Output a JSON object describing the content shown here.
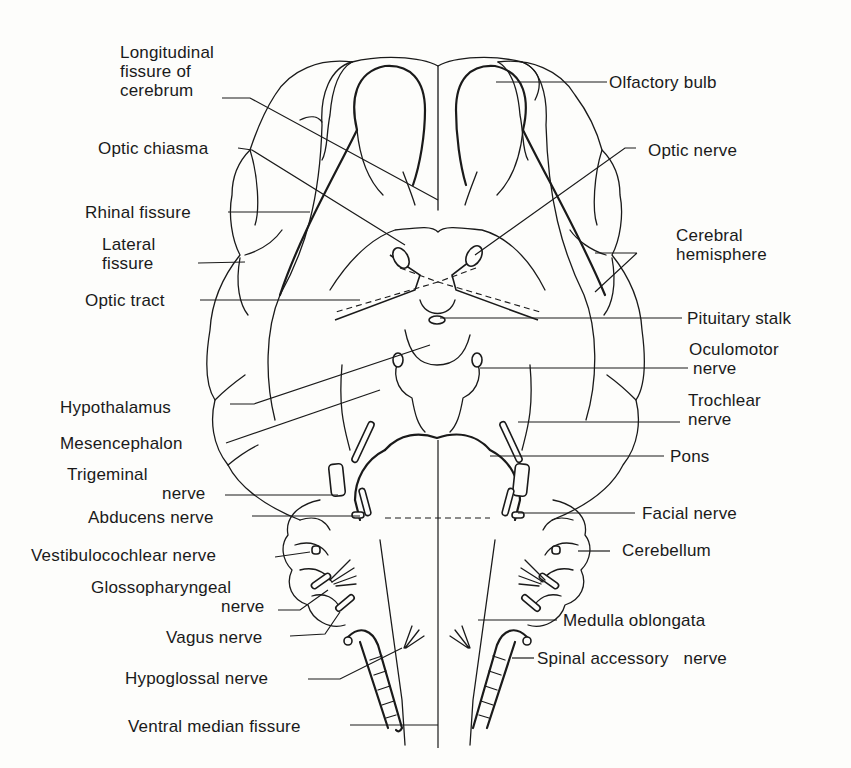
{
  "figure": {
    "line_color": "#1a1a1a",
    "background": "#fdfdfb"
  },
  "labels": {
    "left": [
      {
        "id": "longitudinal_fissure",
        "lines": [
          "Longitudinal",
          "fissure of",
          "cerebrum"
        ]
      },
      {
        "id": "optic_chiasma",
        "lines": [
          "Optic chiasma"
        ]
      },
      {
        "id": "rhinal_fissure",
        "lines": [
          "Rhinal fissure"
        ]
      },
      {
        "id": "lateral_fissure",
        "lines": [
          "Lateral",
          "fissure"
        ]
      },
      {
        "id": "optic_tract",
        "lines": [
          "Optic tract"
        ]
      },
      {
        "id": "hypothalamus",
        "lines": [
          "Hypothalamus"
        ]
      },
      {
        "id": "mesencephalon",
        "lines": [
          "Mesencephalon"
        ]
      },
      {
        "id": "trigeminal_nerve",
        "lines": [
          "Trigeminal",
          "nerve"
        ]
      },
      {
        "id": "abducens_nerve",
        "lines": [
          "Abducens nerve"
        ]
      },
      {
        "id": "vestibulocochlear_nerve",
        "lines": [
          "Vestibulocochlear nerve"
        ]
      },
      {
        "id": "glossopharyngeal_nerve",
        "lines": [
          "Glossopharyngeal",
          "nerve"
        ]
      },
      {
        "id": "vagus_nerve",
        "lines": [
          "Vagus nerve"
        ]
      },
      {
        "id": "hypoglossal_nerve",
        "lines": [
          "Hypoglossal nerve"
        ]
      },
      {
        "id": "ventral_median_fissure",
        "lines": [
          "Ventral median fissure"
        ]
      }
    ],
    "right": [
      {
        "id": "olfactory_bulb",
        "lines": [
          "Olfactory bulb"
        ]
      },
      {
        "id": "optic_nerve",
        "lines": [
          "Optic nerve"
        ]
      },
      {
        "id": "cerebral_hemisphere",
        "lines": [
          "Cerebral",
          "hemisphere"
        ]
      },
      {
        "id": "pituitary_stalk",
        "lines": [
          "Pituitary stalk"
        ]
      },
      {
        "id": "oculomotor_nerve",
        "lines": [
          "Oculomotor",
          "nerve"
        ]
      },
      {
        "id": "trochlear_nerve",
        "lines": [
          "Trochlear",
          "nerve"
        ]
      },
      {
        "id": "pons",
        "lines": [
          "Pons"
        ]
      },
      {
        "id": "facial_nerve",
        "lines": [
          "Facial nerve"
        ]
      },
      {
        "id": "cerebellum",
        "lines": [
          "Cerebellum"
        ]
      },
      {
        "id": "medulla_oblongata",
        "lines": [
          "Medulla oblongata"
        ]
      },
      {
        "id": "spinal_accessory_nerve",
        "lines": [
          "Spinal accessory   nerve"
        ]
      }
    ]
  }
}
